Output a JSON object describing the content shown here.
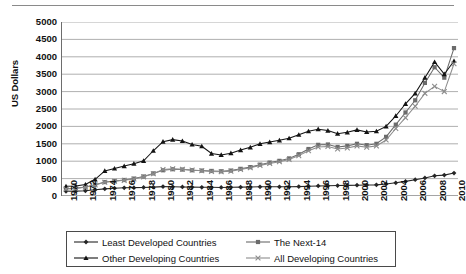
{
  "chart_data": {
    "type": "line",
    "title": "",
    "subtitle": "",
    "xlabel": "",
    "ylabel": "US Dollars",
    "ylim": [
      0,
      5000
    ],
    "xlim": [
      1970,
      2010
    ],
    "yticks": [
      5000,
      4500,
      4000,
      3500,
      3000,
      2500,
      2000,
      1500,
      1000,
      500,
      0
    ],
    "grid": "horizontal",
    "legend_position": "bottom",
    "x": [
      1970,
      1971,
      1972,
      1973,
      1974,
      1975,
      1976,
      1977,
      1978,
      1979,
      1980,
      1981,
      1982,
      1983,
      1984,
      1985,
      1986,
      1987,
      1988,
      1989,
      1990,
      1991,
      1992,
      1993,
      1994,
      1995,
      1996,
      1997,
      1998,
      1999,
      2000,
      2001,
      2002,
      2003,
      2004,
      2005,
      2006,
      2007,
      2008,
      2009,
      2010
    ],
    "xticks": [
      1970,
      1972,
      1974,
      1976,
      1978,
      1980,
      1982,
      1984,
      1986,
      1988,
      1990,
      1992,
      1994,
      1996,
      1998,
      2000,
      2002,
      2004,
      2006,
      2008,
      2010
    ],
    "series": [
      {
        "name": "Least Developed Countries",
        "marker": "diamond",
        "color": "#262626",
        "values": [
          135,
          140,
          150,
          180,
          205,
          225,
          235,
          240,
          245,
          255,
          270,
          265,
          260,
          255,
          250,
          250,
          245,
          250,
          255,
          260,
          265,
          265,
          265,
          265,
          270,
          280,
          290,
          295,
          300,
          305,
          310,
          315,
          320,
          345,
          380,
          420,
          470,
          520,
          580,
          600,
          660
        ]
      },
      {
        "name": "The Next-14",
        "marker": "square",
        "color": "#6b6b6b",
        "values": [
          210,
          225,
          260,
          320,
          400,
          430,
          460,
          500,
          560,
          650,
          740,
          770,
          760,
          740,
          730,
          720,
          710,
          730,
          780,
          830,
          900,
          960,
          1010,
          1080,
          1200,
          1350,
          1470,
          1480,
          1410,
          1440,
          1500,
          1460,
          1500,
          1700,
          2050,
          2400,
          2750,
          3250,
          3700,
          3400,
          4250
        ]
      },
      {
        "name": "Other Developing Countries",
        "marker": "triangle",
        "color": "#131313",
        "values": [
          280,
          290,
          330,
          480,
          720,
          790,
          860,
          930,
          1010,
          1300,
          1560,
          1620,
          1580,
          1480,
          1430,
          1220,
          1180,
          1230,
          1320,
          1400,
          1500,
          1550,
          1600,
          1660,
          1760,
          1860,
          1920,
          1880,
          1790,
          1830,
          1900,
          1840,
          1860,
          2000,
          2300,
          2650,
          2950,
          3400,
          3850,
          3500,
          3880
        ]
      },
      {
        "name": "All Developing Countries",
        "marker": "cross",
        "color": "#8c8c8c",
        "values": [
          200,
          215,
          250,
          315,
          395,
          425,
          450,
          490,
          550,
          640,
          760,
          780,
          770,
          745,
          725,
          705,
          695,
          715,
          760,
          810,
          880,
          935,
          985,
          1050,
          1160,
          1300,
          1410,
          1420,
          1350,
          1380,
          1440,
          1400,
          1440,
          1610,
          1940,
          2250,
          2580,
          2950,
          3150,
          3000,
          3800
        ]
      }
    ]
  },
  "legend": {
    "entries": [
      {
        "label": "Least Developed Countries",
        "marker": "diamond",
        "color": "#262626"
      },
      {
        "label": "The Next-14",
        "marker": "square",
        "color": "#6b6b6b"
      },
      {
        "label": "Other Developing Countries",
        "marker": "triangle",
        "color": "#131313"
      },
      {
        "label": "All Developing Countries",
        "marker": "cross",
        "color": "#8c8c8c"
      }
    ]
  }
}
